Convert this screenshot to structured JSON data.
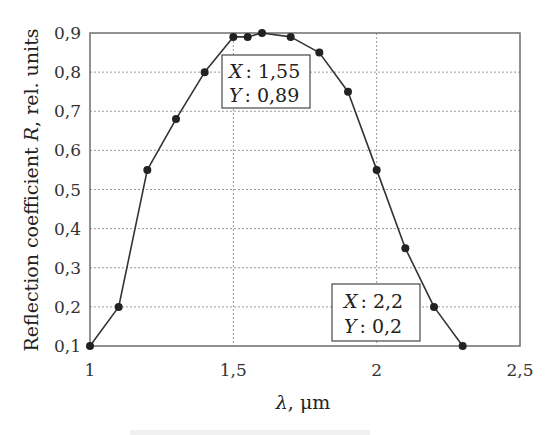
{
  "chart_data": {
    "type": "line",
    "title": "",
    "xlabel": "λ, μm",
    "ylabel": "Reflection coefficient R, rel. units",
    "xlim": [
      1,
      2.5
    ],
    "ylim": [
      0.1,
      0.9
    ],
    "xticks": [
      1,
      1.5,
      2,
      2.5
    ],
    "xtick_labels": [
      "1",
      "1,5",
      "2",
      "2,5"
    ],
    "yticks": [
      0.1,
      0.2,
      0.3,
      0.4,
      0.5,
      0.6,
      0.7,
      0.8,
      0.9
    ],
    "ytick_labels": [
      "0,1",
      "0,2",
      "0,3",
      "0,4",
      "0,5",
      "0,6",
      "0,7",
      "0,8",
      "0,9"
    ],
    "grid": true,
    "legend": "none",
    "series": [
      {
        "name": "R(λ)",
        "color": "#333333",
        "marker": "circle",
        "x": [
          1.0,
          1.1,
          1.2,
          1.3,
          1.4,
          1.5,
          1.55,
          1.6,
          1.7,
          1.8,
          1.9,
          2.0,
          2.1,
          2.2,
          2.3
        ],
        "y": [
          0.1,
          0.2,
          0.55,
          0.68,
          0.8,
          0.89,
          0.89,
          0.9,
          0.89,
          0.85,
          0.75,
          0.55,
          0.35,
          0.2,
          0.1
        ]
      }
    ],
    "annotations": [
      {
        "type": "datatip",
        "x_label": "X",
        "y_label": "Y",
        "x_value": "1,55",
        "y_value": "0,89",
        "position": "below-peak"
      },
      {
        "type": "datatip",
        "x_label": "X",
        "y_label": "Y",
        "x_value": "2,2",
        "y_value": "0,2",
        "position": "bottom-right"
      }
    ]
  },
  "ylabel_parts": {
    "before": "Reflection coefficient ",
    "var": "R",
    "after": ", rel. units"
  },
  "xlabel_parts": {
    "var": "λ",
    "after": ", μm"
  },
  "tips": [
    {
      "x_line_label": "X",
      "x_line_value": ": 1,55",
      "y_line_label": "Y",
      "y_line_value": ": 0,89"
    },
    {
      "x_line_label": "X",
      "x_line_value": ": 2,2",
      "y_line_label": "Y",
      "y_line_value": ": 0,2"
    }
  ],
  "colors": {
    "frame": "#6e6e6e",
    "grid": "#9a9a9a",
    "line": "#333333",
    "marker": "#222222"
  }
}
